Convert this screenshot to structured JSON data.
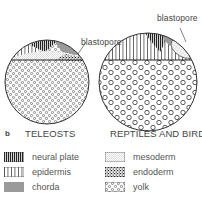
{
  "figure": {
    "panel_label": "b",
    "diagrams": [
      {
        "title": "TELEOSTS",
        "annotation": "blastopore"
      },
      {
        "title": "REPTILES AND BIRDS",
        "annotation": "blastopore"
      }
    ]
  },
  "legend": {
    "items": [
      {
        "key": "neural_plate",
        "label": "neural plate"
      },
      {
        "key": "epidermis",
        "label": "epidermis"
      },
      {
        "key": "chorda",
        "label": "chorda"
      },
      {
        "key": "mesoderm",
        "label": "mesoderm"
      },
      {
        "key": "endoderm",
        "label": "endoderm"
      },
      {
        "key": "yolk",
        "label": "yolk"
      }
    ]
  },
  "colors": {
    "outline": "#333333",
    "chorda": "#9a9a9a",
    "background": "#ffffff"
  }
}
